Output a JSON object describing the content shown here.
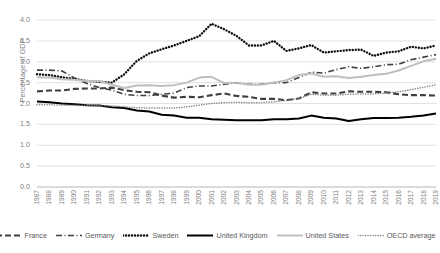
{
  "chart_data": {
    "type": "line",
    "title": "",
    "xlabel": "",
    "ylabel": "Percentage of GDP",
    "ylim": [
      0.0,
      4.0
    ],
    "ytick_labels": [
      "0.0",
      "0.5",
      "1.0",
      "1.5",
      "2.0",
      "2.5",
      "3.0",
      "3.5",
      "4.0"
    ],
    "ytick_values": [
      0.0,
      0.5,
      1.0,
      1.5,
      2.0,
      2.5,
      3.0,
      3.5,
      4.0
    ],
    "grid": true,
    "legend_position": "bottom",
    "x": [
      1987,
      1988,
      1989,
      1990,
      1991,
      1992,
      1993,
      1994,
      1995,
      1996,
      1997,
      1998,
      1999,
      2000,
      2001,
      2002,
      2003,
      2004,
      2005,
      2006,
      2007,
      2008,
      2009,
      2010,
      2011,
      2012,
      2013,
      2014,
      2015,
      2016,
      2017,
      2018,
      2019
    ],
    "categories": [
      "1987",
      "1988",
      "1989",
      "1990",
      "1991",
      "1992",
      "1993",
      "1994",
      "1995",
      "1996",
      "1997",
      "1998",
      "1999",
      "2000",
      "2001",
      "2002",
      "2003",
      "2004",
      "2005",
      "2006",
      "2007",
      "2008",
      "2009",
      "2010",
      "2011",
      "2012",
      "2013",
      "2014",
      "2015",
      "2016",
      "2017",
      "2018",
      "2019"
    ],
    "series": [
      {
        "name": "France",
        "color": "#3F3F3F",
        "style": "dashed",
        "values": [
          2.29,
          2.31,
          2.31,
          2.35,
          2.36,
          2.36,
          2.38,
          2.32,
          2.28,
          2.27,
          2.19,
          2.14,
          2.16,
          2.15,
          2.2,
          2.24,
          2.18,
          2.16,
          2.11,
          2.11,
          2.08,
          2.12,
          2.27,
          2.24,
          2.24,
          2.29,
          2.28,
          2.28,
          2.27,
          2.22,
          2.2,
          2.2,
          2.19
        ],
        "final_value": 2.19
      },
      {
        "name": "Germany",
        "color": "#404040",
        "style": "dashdot",
        "values": [
          2.8,
          2.8,
          2.78,
          2.61,
          2.48,
          2.38,
          2.32,
          2.22,
          2.19,
          2.19,
          2.22,
          2.25,
          2.38,
          2.42,
          2.42,
          2.46,
          2.49,
          2.46,
          2.46,
          2.5,
          2.5,
          2.62,
          2.75,
          2.73,
          2.81,
          2.88,
          2.84,
          2.88,
          2.93,
          2.94,
          3.05,
          3.11,
          3.17
        ],
        "final_value": 3.17
      },
      {
        "name": "Sweden",
        "color": "#111111",
        "style": "dotted",
        "values": [
          2.7,
          2.68,
          2.63,
          2.59,
          2.54,
          2.52,
          2.5,
          2.7,
          3.02,
          3.2,
          3.3,
          3.39,
          3.5,
          3.61,
          3.91,
          3.78,
          3.62,
          3.39,
          3.39,
          3.5,
          3.26,
          3.32,
          3.4,
          3.22,
          3.25,
          3.28,
          3.29,
          3.14,
          3.22,
          3.25,
          3.36,
          3.32,
          3.39
        ],
        "final_value": 3.39
      },
      {
        "name": "United Kingdom",
        "color": "#000000",
        "style": "solid",
        "values": [
          2.05,
          2.03,
          2.0,
          1.98,
          1.96,
          1.95,
          1.91,
          1.89,
          1.83,
          1.81,
          1.73,
          1.71,
          1.66,
          1.66,
          1.62,
          1.61,
          1.6,
          1.6,
          1.6,
          1.62,
          1.62,
          1.64,
          1.71,
          1.66,
          1.64,
          1.58,
          1.62,
          1.65,
          1.65,
          1.66,
          1.68,
          1.71,
          1.76
        ],
        "final_value": 1.76
      },
      {
        "name": "United States",
        "color": "#BFBFBF",
        "style": "solid",
        "values": [
          2.63,
          2.62,
          2.58,
          2.57,
          2.54,
          2.54,
          2.45,
          2.37,
          2.43,
          2.44,
          2.42,
          2.44,
          2.5,
          2.62,
          2.64,
          2.49,
          2.5,
          2.45,
          2.45,
          2.5,
          2.56,
          2.68,
          2.72,
          2.64,
          2.65,
          2.61,
          2.64,
          2.68,
          2.71,
          2.79,
          2.9,
          3.01,
          3.07
        ],
        "final_value": 3.07
      },
      {
        "name": "OECD average",
        "color": "#808080",
        "style": "finedotted",
        "values": [
          1.97,
          1.97,
          1.96,
          1.96,
          1.96,
          1.95,
          1.94,
          1.92,
          1.9,
          1.89,
          1.89,
          1.89,
          1.92,
          1.96,
          2.0,
          2.02,
          2.03,
          2.02,
          2.02,
          2.04,
          2.07,
          2.12,
          2.22,
          2.2,
          2.2,
          2.22,
          2.23,
          2.23,
          2.25,
          2.28,
          2.33,
          2.39,
          2.45
        ],
        "final_value": 2.45
      }
    ]
  },
  "axis": {
    "ylabel": "Percentage of GDP"
  },
  "legend": {
    "items": [
      {
        "label": "France"
      },
      {
        "label": "Germany"
      },
      {
        "label": "Sweden"
      },
      {
        "label": "United Kingdom"
      },
      {
        "label": "United States"
      },
      {
        "label": "OECD average"
      }
    ]
  }
}
